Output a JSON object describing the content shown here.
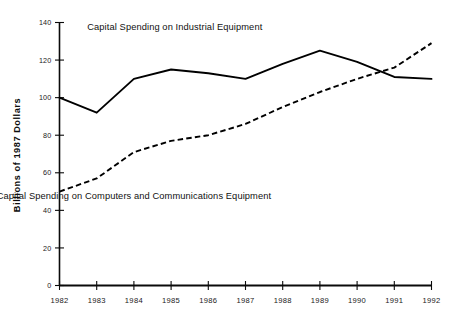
{
  "chart_data": {
    "type": "line",
    "title": "",
    "subtitle": "",
    "xlabel": "",
    "ylabel": "Billions of 1987 Dollars",
    "x": [
      1982,
      1983,
      1984,
      1985,
      1986,
      1987,
      1988,
      1989,
      1990,
      1991,
      1992
    ],
    "categories": [
      "1982",
      "1983",
      "1984",
      "1985",
      "1986",
      "1987",
      "1988",
      "1989",
      "1990",
      "1991",
      "1992"
    ],
    "xlim": [
      1982,
      1992
    ],
    "ylim": [
      0,
      140
    ],
    "yticks": [
      0,
      20,
      40,
      60,
      80,
      100,
      120,
      140
    ],
    "ytick_labels": [
      "0",
      "20",
      "40",
      "60",
      "80",
      "100",
      "120",
      "140"
    ],
    "xticks": [
      1982,
      1983,
      1984,
      1985,
      1986,
      1987,
      1988,
      1989,
      1990,
      1991,
      1992
    ],
    "xtick_labels": [
      "1982",
      "1983",
      "1984",
      "1985",
      "1986",
      "1987",
      "1988",
      "1989",
      "1990",
      "1991",
      "1992"
    ],
    "grid": false,
    "legend_position": "inline-annotation",
    "series": [
      {
        "name": "Capital Spending on Industrial Equipment",
        "style": "solid",
        "color": "#000000",
        "values": [
          100,
          92,
          110,
          115,
          113,
          110,
          118,
          125,
          119,
          111,
          110
        ]
      },
      {
        "name": "Capital Spending on Computers and Communications Equipment",
        "style": "dashed",
        "color": "#000000",
        "values": [
          50,
          57,
          71,
          77,
          80,
          86,
          95,
          103,
          110,
          116,
          129
        ]
      }
    ],
    "annotations": [
      {
        "text": "Capital Spending on Industrial Equipment",
        "x": 1985.1,
        "y": 136
      },
      {
        "text": "Capital Spending on Computers and Communications Equipment",
        "x": 1984.0,
        "y": 46
      }
    ]
  },
  "axes": {
    "y_axis_title": "Billions of 1987 Dollars"
  }
}
